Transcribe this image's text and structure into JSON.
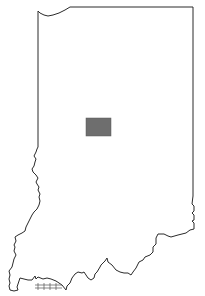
{
  "map": {
    "region": "Indiana",
    "style": "state outline with highlighted county",
    "outline_color": "#2a2a2a",
    "background_color": "#ffffff",
    "highlighted_county": {
      "shape": "rectangle",
      "fill_color": "#6e6e6e",
      "bounds_px": {
        "x": 86,
        "y": 118,
        "width": 25,
        "height": 18
      }
    }
  }
}
